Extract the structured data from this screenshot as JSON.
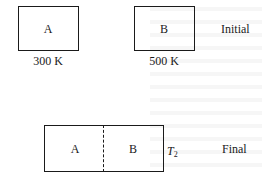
{
  "diagram": {
    "initial": {
      "state_label": "Initial",
      "box_a": {
        "label": "A",
        "temperature": "300 K"
      },
      "box_b": {
        "label": "B",
        "temperature": "500 K"
      }
    },
    "final": {
      "state_label": "Final",
      "box_a": {
        "label": "A"
      },
      "box_b": {
        "label": "B"
      },
      "temperature_symbol": "T",
      "temperature_subscript": "2",
      "partition": "dashed"
    }
  }
}
